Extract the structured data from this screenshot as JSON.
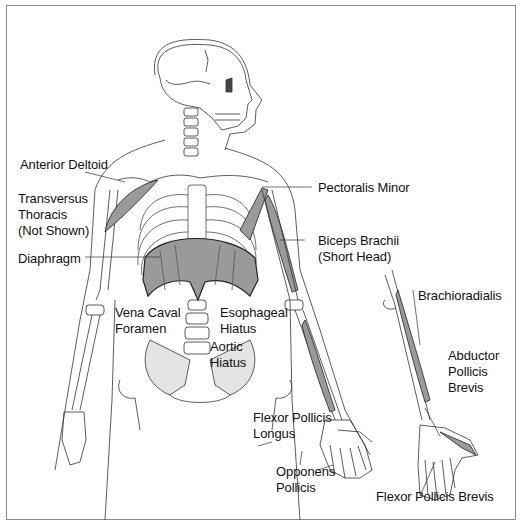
{
  "figure": {
    "labels": {
      "anterior_deltoid": "Anterior Deltoid",
      "transversus_thoracis_1": "Transversus",
      "transversus_thoracis_2": "Thoracis",
      "transversus_thoracis_3": "(Not Shown)",
      "diaphragm": "Diaphragm",
      "pectoralis_minor": "Pectoralis Minor",
      "biceps_brachii_1": "Biceps Brachii",
      "biceps_brachii_2": "(Short Head)",
      "vena_caval_1": "Vena Caval",
      "vena_caval_2": "Foramen",
      "esophageal_1": "Esophageal",
      "esophageal_2": "Hiatus",
      "aortic_1": "Aortic",
      "aortic_2": "Hiatus",
      "brachioradialis": "Brachioradialis",
      "abductor_1": "Abductor",
      "abductor_2": "Pollicis",
      "abductor_3": "Brevis",
      "flexor_longus_1": "Flexor Pollicis",
      "flexor_longus_2": "Longus",
      "opponens_1": "Opponens",
      "opponens_2": "Pollicis",
      "flexor_brevis": "Flexor Pollicis Brevis"
    },
    "colors": {
      "muscle_fill": "#9a9a9a",
      "line": "#222222",
      "frame": "#8a8a8a"
    }
  }
}
